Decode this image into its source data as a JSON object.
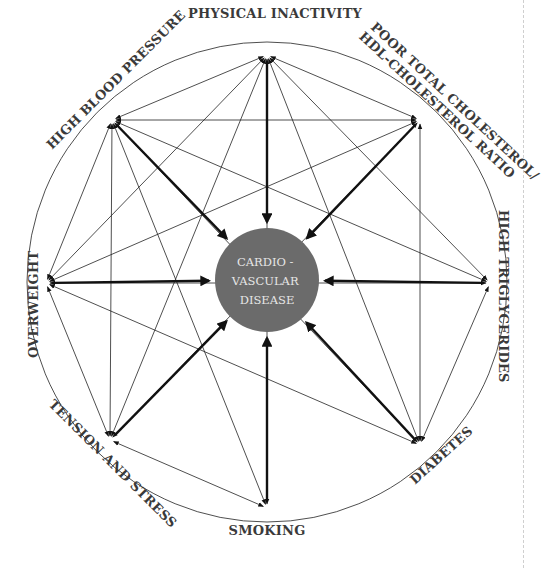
{
  "diagram": {
    "center": {
      "lines": [
        "CARDIO -",
        "VASCULAR",
        "DISEASE"
      ],
      "fill": "#6b6b6b",
      "text_color": "#e6e6e6",
      "cx": 267,
      "cy": 280,
      "r": 52
    },
    "outer_circle": {
      "cx": 267,
      "cy": 282,
      "r": 240
    },
    "nodes": [
      {
        "id": "physical-inactivity",
        "label": "PHYSICAL INACTIVITY",
        "x": 267,
        "y": 55
      },
      {
        "id": "poor-cholesterol",
        "label_line1": "POOR TOTAL CHOLESTEROL/",
        "label_line2": "HDL-CHOLESTEROL RATIO",
        "x": 420,
        "y": 120
      },
      {
        "id": "high-triglycerides",
        "label": "HIGH TRIGLYCERIDES",
        "x": 490,
        "y": 283
      },
      {
        "id": "diabetes",
        "label": "DIABETES",
        "x": 420,
        "y": 445
      },
      {
        "id": "smoking",
        "label": "SMOKING",
        "x": 267,
        "y": 508
      },
      {
        "id": "tension-and-stress",
        "label": "TENSION AND STRESS",
        "x": 110,
        "y": 440
      },
      {
        "id": "overweight",
        "label": "OVERWEIGHT",
        "x": 46,
        "y": 283
      },
      {
        "id": "high-blood-pressure",
        "label": "HIGH BLOOD PRESSURE",
        "x": 112,
        "y": 120
      }
    ],
    "thick_arrows_to_center": [
      "physical-inactivity",
      "poor-cholesterol",
      "high-triglycerides",
      "diabetes",
      "smoking",
      "tension-and-stress",
      "overweight",
      "high-blood-pressure"
    ],
    "interconnections": [
      [
        "physical-inactivity",
        "high-blood-pressure"
      ],
      [
        "physical-inactivity",
        "overweight"
      ],
      [
        "physical-inactivity",
        "tension-and-stress"
      ],
      [
        "physical-inactivity",
        "diabetes"
      ],
      [
        "physical-inactivity",
        "high-triglycerides"
      ],
      [
        "physical-inactivity",
        "poor-cholesterol"
      ],
      [
        "physical-inactivity",
        "smoking"
      ],
      [
        "high-blood-pressure",
        "poor-cholesterol"
      ],
      [
        "high-blood-pressure",
        "high-triglycerides"
      ],
      [
        "high-blood-pressure",
        "diabetes"
      ],
      [
        "high-blood-pressure",
        "smoking"
      ],
      [
        "high-blood-pressure",
        "tension-and-stress"
      ],
      [
        "high-blood-pressure",
        "overweight"
      ],
      [
        "overweight",
        "poor-cholesterol"
      ],
      [
        "overweight",
        "diabetes"
      ],
      [
        "overweight",
        "tension-and-stress"
      ],
      [
        "overweight",
        "high-triglycerides"
      ],
      [
        "tension-and-stress",
        "smoking"
      ],
      [
        "tension-and-stress",
        "poor-cholesterol"
      ],
      [
        "poor-cholesterol",
        "diabetes"
      ],
      [
        "high-triglycerides",
        "diabetes"
      ]
    ]
  }
}
